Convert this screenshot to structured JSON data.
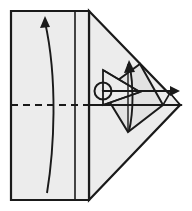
{
  "figure": {
    "caption": "",
    "background_color": "#ffffff",
    "paper_fill": "#ececec",
    "paper_fill_shade": "#e2e2e2",
    "outline_color": "#1a1a1a",
    "crease_color": "#1a1a1a",
    "arrow_color": "#1a1a1a"
  },
  "canvas": {
    "width": 192,
    "height": 211,
    "view_box": "0 0 192 211"
  },
  "shapes": {
    "body_rectangle": {
      "name": "left-rectangle-panel",
      "points": "11,11 89,11 89,200 11,200",
      "fill": "#ececec",
      "stroke_width": 2.2
    },
    "upper_wing": {
      "name": "upper-right-triangle-flap",
      "points": "89,11 180,105 89,105",
      "fill": "#ececec",
      "stroke_width": 2.2
    },
    "lower_wing": {
      "name": "lower-right-triangle-flap",
      "points": "89,105 180,105 89,200",
      "fill": "#ececec",
      "stroke_width": 2.2
    },
    "inner_kite": {
      "name": "inner-kite-flap",
      "points": "103,91 140,64 163,105 128,132",
      "fill": "#e2e2e2",
      "stroke_width": 2.0
    },
    "inner_left_triangle": {
      "name": "inner-left-triangle",
      "points": "103,70 103,105 140,92",
      "fill": "#ececec",
      "stroke_width": 1.8
    },
    "tip_notch": {
      "name": "right-tip-notch",
      "points": "163,105 180,105 170,93",
      "fill": "#ececec",
      "stroke_width": 1.6
    }
  },
  "creases": [
    {
      "name": "horizontal-valley-crease-dashed",
      "style": "dashed",
      "d": "M 11,105 L 89,105",
      "dash_pattern": "7,5",
      "stroke_width": 2.0
    },
    {
      "name": "horizontal-crease-right-solid",
      "style": "solid",
      "d": "M 89,105 L 180,105",
      "stroke_width": 2.0
    },
    {
      "name": "vertical-crease-panel-divider",
      "style": "solid",
      "d": "M 75,11 L 75,200",
      "stroke_width": 1.6
    },
    {
      "name": "kite-horizontal-crease",
      "style": "solid",
      "d": "M 103,91 L 163,91",
      "stroke_width": 2.0
    },
    {
      "name": "kite-diagonal-crease-upper",
      "style": "solid",
      "d": "M 103,70 L 140,92",
      "stroke_width": 1.8
    },
    {
      "name": "kite-diagonal-crease-lower",
      "style": "solid",
      "d": "M 103,105 L 140,92",
      "stroke_width": 1.8
    },
    {
      "name": "kite-center-vertical-crease",
      "style": "solid",
      "d": "M 128,64 L 128,132",
      "stroke_width": 1.4
    }
  ],
  "arrows": [
    {
      "name": "large-fold-arrow-upward",
      "description": "long curved arrow sweeping up the left panel",
      "path": "M 47,193 C 54,150 58,80 45,22",
      "head_points": "45,16 40,28 50,27",
      "stroke_width": 1.9,
      "direction": "up"
    },
    {
      "name": "small-fold-arrow-upward",
      "description": "short curved arrow inside the kite pointing up",
      "path": "M 129,131 C 134,110 133,84 130,66",
      "head_points": "129,60 124,73 135,72",
      "stroke_width": 1.9,
      "direction": "up"
    },
    {
      "name": "horizontal-pull-arrow-right",
      "description": "straight arrow from circle marker to right tip",
      "path": "M 103,91 L 174,91",
      "head_points": "180,91 170,86 170,96",
      "stroke_width": 2.2,
      "direction": "right"
    }
  ],
  "markers": [
    {
      "name": "pivot-point-circle",
      "cx": 103,
      "cy": 91,
      "r": 8.5,
      "stroke_width": 2.0,
      "fill": "none"
    }
  ]
}
